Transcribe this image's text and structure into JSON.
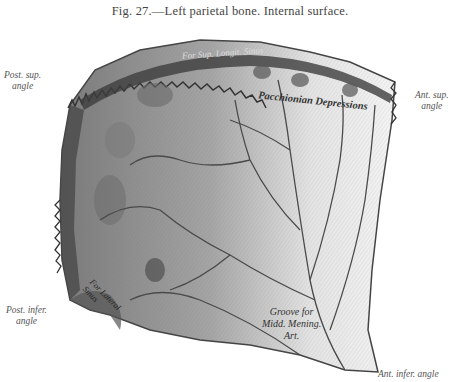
{
  "figure": {
    "caption": "Fig. 27.—Left parietal bone.   Internal surface."
  },
  "labels": {
    "post_sup_angle": [
      "Post. sup.",
      "angle"
    ],
    "ant_sup_angle": [
      "Ant. sup.",
      "angle"
    ],
    "post_infer_angle": [
      "Post. infer.",
      "angle"
    ],
    "ant_infer_angle": "Ant. infer. angle",
    "sup_longit_sinus": "For Sup. Longit. Sinus",
    "pacchionian": "Pacchionian Depressions",
    "groove": [
      "Groove for",
      "Midd. Mening.",
      "Art."
    ],
    "lateral_sinus": [
      "For Lateral",
      "Sinus"
    ]
  },
  "colors": {
    "bone_fill": "#9a9a9a",
    "bone_light": "#d8d8d8",
    "dark_edge": "#3a3a3a",
    "vessel": "#4a4a4a"
  }
}
